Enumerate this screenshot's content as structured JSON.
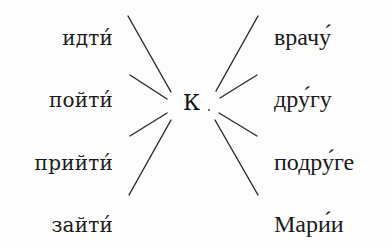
{
  "diagram": {
    "center": {
      "label": "К"
    },
    "verbs": [
      {
        "text": "идти́"
      },
      {
        "text": "пойти́"
      },
      {
        "text": "прийти́"
      },
      {
        "text": "зайти́"
      }
    ],
    "destinations": [
      {
        "text": "врачу́"
      },
      {
        "text": "дру́гу"
      },
      {
        "text": "подру́ге"
      },
      {
        "text": "Мари́и"
      }
    ],
    "colors": {
      "ink": "#1a1a1a",
      "background": "#fdfdfd"
    }
  }
}
